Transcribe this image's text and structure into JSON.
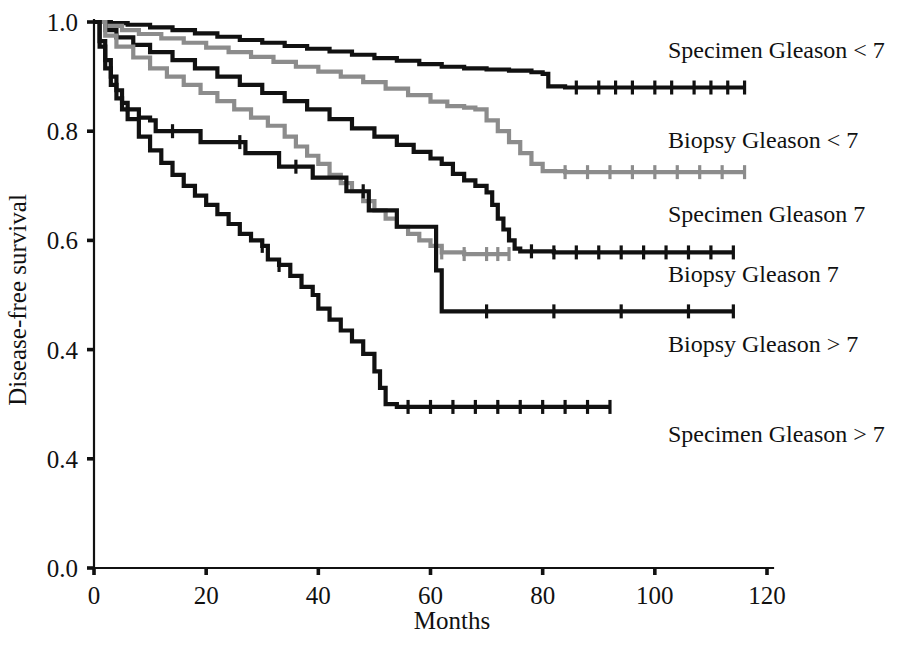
{
  "chart_data": {
    "type": "line",
    "subtype": "kaplan-meier-survival",
    "title": "",
    "xlabel": "Months",
    "ylabel": "Disease-free survival",
    "xlim": [
      0,
      120
    ],
    "ylim": [
      0.0,
      1.0
    ],
    "grid": false,
    "legend_position": "right-inline-labels",
    "xticks": [
      0,
      20,
      40,
      60,
      80,
      100,
      120
    ],
    "xtick_labels": [
      "0",
      "20",
      "40",
      "60",
      "80",
      "100",
      "120"
    ],
    "yticks": [
      0.0,
      0.2,
      0.4,
      0.6,
      0.8,
      1.0
    ],
    "ytick_labels": [
      "0.0",
      "0.4",
      "0.4",
      "0.6",
      "0.8",
      "1.0"
    ],
    "ytick_label_note": "As printed in the source figure the 0.2 tick is mislabelled 0.4",
    "colors": {
      "black": "#111111",
      "gray": "#8c8c8c"
    },
    "series": [
      {
        "name": "Specimen Gleason < 7",
        "label": "Specimen Gleason < 7",
        "color": "#111111",
        "label_x": 668,
        "label_y": 58,
        "final_survival": 0.88,
        "censor_months": [
          86,
          90,
          93,
          96,
          100,
          103,
          107,
          110,
          113,
          116
        ],
        "points": [
          [
            0,
            1.0
          ],
          [
            3,
            0.998
          ],
          [
            6,
            0.995
          ],
          [
            10,
            0.99
          ],
          [
            14,
            0.985
          ],
          [
            18,
            0.979
          ],
          [
            22,
            0.973
          ],
          [
            26,
            0.967
          ],
          [
            30,
            0.962
          ],
          [
            34,
            0.956
          ],
          [
            38,
            0.951
          ],
          [
            42,
            0.946
          ],
          [
            46,
            0.94
          ],
          [
            50,
            0.934
          ],
          [
            54,
            0.929
          ],
          [
            58,
            0.923
          ],
          [
            62,
            0.918
          ],
          [
            66,
            0.915
          ],
          [
            70,
            0.913
          ],
          [
            74,
            0.911
          ],
          [
            78,
            0.908
          ],
          [
            80,
            0.905
          ],
          [
            81,
            0.882
          ],
          [
            84,
            0.88
          ],
          [
            90,
            0.88
          ],
          [
            100,
            0.88
          ],
          [
            110,
            0.88
          ],
          [
            116,
            0.88
          ]
        ]
      },
      {
        "name": "Biopsy Gleason < 7",
        "label": "Biopsy Gleason < 7",
        "color": "#8c8c8c",
        "label_x": 668,
        "label_y": 148,
        "final_survival": 0.725,
        "censor_months": [
          84,
          88,
          92,
          96,
          100,
          104,
          108,
          112,
          116
        ],
        "points": [
          [
            0,
            1.0
          ],
          [
            2,
            0.993
          ],
          [
            5,
            0.985
          ],
          [
            8,
            0.978
          ],
          [
            12,
            0.97
          ],
          [
            16,
            0.962
          ],
          [
            20,
            0.953
          ],
          [
            24,
            0.945
          ],
          [
            28,
            0.936
          ],
          [
            32,
            0.927
          ],
          [
            36,
            0.918
          ],
          [
            40,
            0.909
          ],
          [
            44,
            0.9
          ],
          [
            48,
            0.89
          ],
          [
            52,
            0.878
          ],
          [
            56,
            0.866
          ],
          [
            60,
            0.854
          ],
          [
            63,
            0.846
          ],
          [
            66,
            0.843
          ],
          [
            68,
            0.84
          ],
          [
            70,
            0.82
          ],
          [
            72,
            0.8
          ],
          [
            74,
            0.78
          ],
          [
            76,
            0.76
          ],
          [
            78,
            0.74
          ],
          [
            80,
            0.727
          ],
          [
            84,
            0.725
          ],
          [
            92,
            0.725
          ],
          [
            104,
            0.725
          ],
          [
            116,
            0.725
          ]
        ]
      },
      {
        "name": "Specimen Gleason 7",
        "label": "Specimen Gleason 7",
        "color": "#111111",
        "label_x": 668,
        "label_y": 222,
        "final_survival": 0.578,
        "censor_months": [
          78,
          82,
          86,
          90,
          94,
          98,
          102,
          106,
          110,
          114
        ],
        "points": [
          [
            0,
            1.0
          ],
          [
            2,
            0.985
          ],
          [
            4,
            0.972
          ],
          [
            7,
            0.958
          ],
          [
            10,
            0.945
          ],
          [
            14,
            0.93
          ],
          [
            18,
            0.915
          ],
          [
            22,
            0.9
          ],
          [
            26,
            0.885
          ],
          [
            30,
            0.87
          ],
          [
            34,
            0.855
          ],
          [
            38,
            0.84
          ],
          [
            42,
            0.822
          ],
          [
            46,
            0.805
          ],
          [
            50,
            0.79
          ],
          [
            54,
            0.775
          ],
          [
            57,
            0.762
          ],
          [
            60,
            0.75
          ],
          [
            62,
            0.74
          ],
          [
            64,
            0.722
          ],
          [
            66,
            0.71
          ],
          [
            68,
            0.7
          ],
          [
            70,
            0.688
          ],
          [
            71,
            0.665
          ],
          [
            72,
            0.64
          ],
          [
            73,
            0.62
          ],
          [
            74,
            0.6
          ],
          [
            75,
            0.585
          ],
          [
            76,
            0.58
          ],
          [
            82,
            0.578
          ],
          [
            95,
            0.578
          ],
          [
            108,
            0.578
          ],
          [
            114,
            0.578
          ]
        ]
      },
      {
        "name": "Biopsy Gleason 7",
        "label": "Biopsy Gleason 7",
        "color": "#8c8c8c",
        "label_x": 668,
        "label_y": 282,
        "final_survival": 0.575,
        "censor_months": [
          62,
          66,
          70,
          72,
          74
        ],
        "points": [
          [
            0,
            1.0
          ],
          [
            2,
            0.975
          ],
          [
            4,
            0.955
          ],
          [
            7,
            0.935
          ],
          [
            10,
            0.915
          ],
          [
            13,
            0.9
          ],
          [
            16,
            0.885
          ],
          [
            19,
            0.87
          ],
          [
            22,
            0.855
          ],
          [
            25,
            0.84
          ],
          [
            28,
            0.825
          ],
          [
            31,
            0.81
          ],
          [
            34,
            0.79
          ],
          [
            36,
            0.772
          ],
          [
            38,
            0.755
          ],
          [
            40,
            0.74
          ],
          [
            42,
            0.72
          ],
          [
            44,
            0.705
          ],
          [
            46,
            0.69
          ],
          [
            48,
            0.672
          ],
          [
            50,
            0.655
          ],
          [
            52,
            0.64
          ],
          [
            54,
            0.625
          ],
          [
            56,
            0.612
          ],
          [
            58,
            0.6
          ],
          [
            60,
            0.59
          ],
          [
            62,
            0.578
          ],
          [
            66,
            0.575
          ],
          [
            70,
            0.575
          ],
          [
            74,
            0.575
          ]
        ]
      },
      {
        "name": "Biopsy Gleason > 7",
        "label": "Biopsy Gleason > 7",
        "color": "#111111",
        "label_x": 668,
        "label_y": 352,
        "final_survival": 0.47,
        "censor_months": [
          14,
          26,
          36,
          48,
          70,
          82,
          94,
          106,
          114
        ],
        "points": [
          [
            0,
            1.0
          ],
          [
            1,
            0.965
          ],
          [
            2,
            0.93
          ],
          [
            3,
            0.9
          ],
          [
            4,
            0.875
          ],
          [
            5,
            0.852
          ],
          [
            6,
            0.84
          ],
          [
            8,
            0.825
          ],
          [
            10,
            0.82
          ],
          [
            11,
            0.8
          ],
          [
            18,
            0.8
          ],
          [
            19,
            0.78
          ],
          [
            26,
            0.78
          ],
          [
            27,
            0.76
          ],
          [
            32,
            0.76
          ],
          [
            33,
            0.735
          ],
          [
            38,
            0.735
          ],
          [
            39,
            0.715
          ],
          [
            44,
            0.715
          ],
          [
            45,
            0.69
          ],
          [
            48,
            0.69
          ],
          [
            49,
            0.655
          ],
          [
            53,
            0.655
          ],
          [
            54,
            0.625
          ],
          [
            60,
            0.625
          ],
          [
            61,
            0.545
          ],
          [
            62,
            0.47
          ],
          [
            70,
            0.47
          ],
          [
            85,
            0.47
          ],
          [
            100,
            0.47
          ],
          [
            114,
            0.47
          ]
        ]
      },
      {
        "name": "Specimen Gleason > 7",
        "label": "Specimen Gleason > 7",
        "color": "#111111",
        "label_x": 668,
        "label_y": 442,
        "final_survival": 0.295,
        "censor_months": [
          30,
          33,
          56,
          60,
          64,
          68,
          72,
          76,
          80,
          84,
          88,
          92
        ],
        "points": [
          [
            0,
            1.0
          ],
          [
            1,
            0.955
          ],
          [
            2,
            0.915
          ],
          [
            3,
            0.885
          ],
          [
            4,
            0.86
          ],
          [
            5,
            0.84
          ],
          [
            6,
            0.822
          ],
          [
            8,
            0.79
          ],
          [
            10,
            0.765
          ],
          [
            12,
            0.742
          ],
          [
            14,
            0.72
          ],
          [
            16,
            0.7
          ],
          [
            18,
            0.682
          ],
          [
            20,
            0.665
          ],
          [
            22,
            0.648
          ],
          [
            24,
            0.63
          ],
          [
            26,
            0.612
          ],
          [
            28,
            0.6
          ],
          [
            30,
            0.59
          ],
          [
            31,
            0.565
          ],
          [
            33,
            0.555
          ],
          [
            35,
            0.535
          ],
          [
            37,
            0.515
          ],
          [
            39,
            0.5
          ],
          [
            40,
            0.475
          ],
          [
            42,
            0.455
          ],
          [
            44,
            0.435
          ],
          [
            46,
            0.415
          ],
          [
            48,
            0.392
          ],
          [
            50,
            0.36
          ],
          [
            51,
            0.33
          ],
          [
            52,
            0.3
          ],
          [
            54,
            0.295
          ],
          [
            60,
            0.295
          ],
          [
            70,
            0.295
          ],
          [
            80,
            0.295
          ],
          [
            92,
            0.295
          ]
        ]
      }
    ]
  }
}
